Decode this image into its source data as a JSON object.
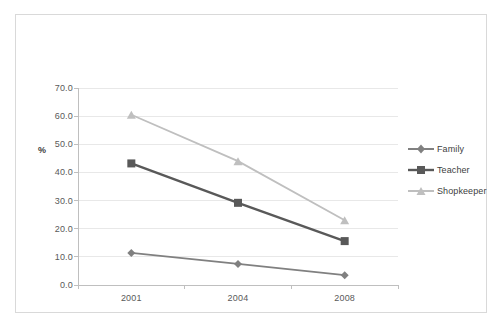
{
  "chart_data": {
    "type": "line",
    "title": "",
    "xlabel": "",
    "ylabel": "%",
    "categories": [
      "2001",
      "2004",
      "2008"
    ],
    "ylim": [
      0.0,
      70.0
    ],
    "ytick_step": 10.0,
    "ytick_labels": [
      "0.0",
      "10.0",
      "20.0",
      "30.0",
      "40.0",
      "50.0",
      "60.0",
      "70.0"
    ],
    "ytick_values": [
      0.0,
      10.0,
      20.0,
      30.0,
      40.0,
      50.0,
      60.0,
      70.0
    ],
    "grid": "horizontal",
    "legend_position": "right",
    "series": [
      {
        "name": "Family",
        "values": [
          11.4,
          7.5,
          3.5
        ],
        "color": "#808080",
        "marker": "diamond"
      },
      {
        "name": "Teacher",
        "values": [
          43.2,
          29.2,
          15.6
        ],
        "color": "#595959",
        "marker": "square"
      },
      {
        "name": "Shopkeeper",
        "values": [
          60.5,
          44.0,
          23.0
        ],
        "color": "#bfbfbf",
        "marker": "triangle"
      }
    ]
  },
  "frame": {
    "border_color": "#d9d9d9",
    "background": "#ffffff"
  },
  "axis": {
    "line_color": "#bfbfbf",
    "grid_color": "#e8e8e8",
    "label_color": "#595959"
  }
}
